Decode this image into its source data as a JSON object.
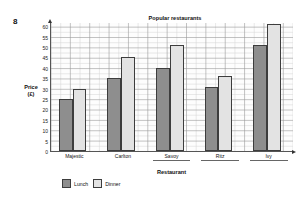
{
  "question_number": "8",
  "y_axis": {
    "title_line1": "Price",
    "title_line2": "(£)",
    "ticks": [
      "0",
      "5",
      "10",
      "15",
      "20",
      "25",
      "30",
      "35",
      "40",
      "45",
      "50",
      "55",
      "60"
    ]
  },
  "x_axis": {
    "title": "Restaurant"
  },
  "legend": {
    "entries": [
      {
        "label": "Lunch",
        "color": "#8e8e8e"
      },
      {
        "label": "Dinner",
        "color": "#e3e3e3"
      }
    ]
  },
  "chart_data": {
    "type": "bar",
    "title": "Popular restaurants",
    "xlabel": "Restaurant",
    "ylabel": "Price (£)",
    "ylim": [
      0,
      62
    ],
    "ytick_step": 5,
    "grid": true,
    "grid_minor_step": 2.5,
    "legend_position": "bottom-left",
    "categories": [
      "Majestic",
      "Carlton",
      "Savoy",
      "Ritz",
      "Ivy"
    ],
    "category_has_answer_rule": [
      false,
      false,
      true,
      true,
      true
    ],
    "series": [
      {
        "name": "Lunch",
        "color": "#8e8e8e",
        "values": [
          25,
          35,
          40,
          31,
          51
        ]
      },
      {
        "name": "Dinner",
        "color": "#e3e3e3",
        "values": [
          30,
          45,
          51,
          36,
          61
        ]
      }
    ]
  }
}
